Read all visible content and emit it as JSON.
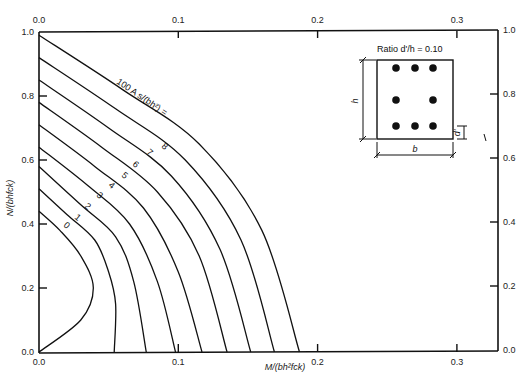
{
  "chart_data": {
    "type": "line",
    "title": "",
    "xlabel": "M/(bh²fck)",
    "ylabel": "N/(bhfck)",
    "xlim": [
      0.0,
      0.33
    ],
    "ylim": [
      0.0,
      1.0
    ],
    "x_ticks": [
      "0.0",
      "0.1",
      "0.2",
      "0.3"
    ],
    "y_ticks": [
      "0.0",
      "0.2",
      "0.4",
      "0.6",
      "0.8",
      "1.0"
    ],
    "top_x_ticks": [
      "0.0",
      "0.1",
      "0.2",
      "0.3"
    ],
    "right_y_ticks": [
      "0.0",
      "0.2",
      "0.4",
      "0.6",
      "0.8",
      "1.0"
    ],
    "grid": false,
    "curve_family_label": "100 A s/(bh²) =",
    "series": [
      {
        "name": "0",
        "points": [
          [
            0.0,
            0.44
          ],
          [
            0.015,
            0.38
          ],
          [
            0.03,
            0.3
          ],
          [
            0.039,
            0.2
          ],
          [
            0.03,
            0.1
          ],
          [
            0.0,
            0.0
          ]
        ]
      },
      {
        "name": "1",
        "points": [
          [
            0.0,
            0.51
          ],
          [
            0.02,
            0.43
          ],
          [
            0.04,
            0.35
          ],
          [
            0.05,
            0.25
          ],
          [
            0.055,
            0.15
          ],
          [
            0.054,
            0.0
          ]
        ]
      },
      {
        "name": "2",
        "points": [
          [
            0.0,
            0.58
          ],
          [
            0.03,
            0.46
          ],
          [
            0.055,
            0.36
          ],
          [
            0.068,
            0.22
          ],
          [
            0.077,
            0.0
          ]
        ]
      },
      {
        "name": "3",
        "points": [
          [
            0.0,
            0.64
          ],
          [
            0.035,
            0.52
          ],
          [
            0.065,
            0.4
          ],
          [
            0.085,
            0.22
          ],
          [
            0.098,
            0.0
          ]
        ]
      },
      {
        "name": "4",
        "points": [
          [
            0.0,
            0.71
          ],
          [
            0.04,
            0.58
          ],
          [
            0.075,
            0.45
          ],
          [
            0.1,
            0.25
          ],
          [
            0.117,
            0.0
          ]
        ]
      },
      {
        "name": "5",
        "points": [
          [
            0.0,
            0.78
          ],
          [
            0.045,
            0.64
          ],
          [
            0.085,
            0.5
          ],
          [
            0.115,
            0.3
          ],
          [
            0.135,
            0.0
          ]
        ]
      },
      {
        "name": "6",
        "points": [
          [
            0.0,
            0.85
          ],
          [
            0.05,
            0.7
          ],
          [
            0.095,
            0.55
          ],
          [
            0.13,
            0.32
          ],
          [
            0.152,
            0.0
          ]
        ]
      },
      {
        "name": "7",
        "points": [
          [
            0.0,
            0.92
          ],
          [
            0.055,
            0.76
          ],
          [
            0.105,
            0.6
          ],
          [
            0.145,
            0.35
          ],
          [
            0.169,
            0.0
          ]
        ]
      },
      {
        "name": "8",
        "points": [
          [
            0.0,
            0.99
          ],
          [
            0.06,
            0.82
          ],
          [
            0.115,
            0.65
          ],
          [
            0.16,
            0.38
          ],
          [
            0.187,
            0.0
          ]
        ]
      }
    ],
    "annotations": [
      "Ratio d'/h = 0.10",
      "h",
      "b",
      "d'"
    ]
  },
  "inset": {
    "ratio_label": "Ratio d'/h = 0.10",
    "h_label": "h",
    "b_label": "b",
    "d_label": "d'"
  },
  "axes": {
    "x_title": "M/(bh²fck)",
    "y_title": "N/(bhfck)",
    "family_label": "100 A s/(bh²) ="
  }
}
